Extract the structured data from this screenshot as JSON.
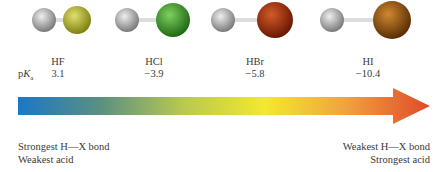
{
  "molecules": [
    {
      "formula": "HF",
      "pka": "3.1",
      "atom_color": "#b8b82a"
    },
    {
      "formula": "HCl",
      "pka": "−3.9",
      "atom_color": "#3fa02c"
    },
    {
      "formula": "HBr",
      "pka": "−5.8",
      "atom_color": "#9e2a0c"
    },
    {
      "formula": "HI",
      "pka": "−10.4",
      "atom_color": "#9a5210"
    }
  ],
  "pka_label": {
    "p": "p",
    "K": "K",
    "sub": "a"
  },
  "arrow": {
    "gradient": [
      "#1a78c8",
      "#5a9080",
      "#b8c850",
      "#f4e830",
      "#f0a040",
      "#e04a28"
    ]
  },
  "captions": {
    "left_line1": "Strongest H—X bond",
    "left_line2": "Weakest acid",
    "right_line1": "Weakest H—X bond",
    "right_line2": "Strongest acid"
  }
}
